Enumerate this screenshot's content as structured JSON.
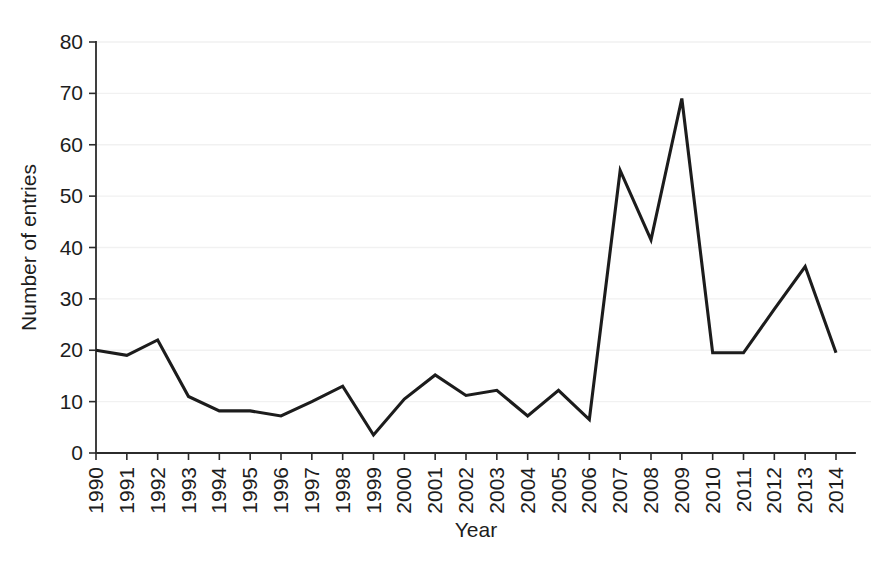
{
  "chart_data": {
    "type": "line",
    "title": "",
    "xlabel": "Year",
    "ylabel": "Number of entries",
    "x": [
      1990,
      1991,
      1992,
      1993,
      1994,
      1995,
      1996,
      1997,
      1998,
      1999,
      2000,
      2001,
      2002,
      2003,
      2004,
      2005,
      2006,
      2007,
      2008,
      2009,
      2010,
      2011,
      2012,
      2013,
      2014
    ],
    "categories": [
      "1990",
      "1991",
      "1992",
      "1993",
      "1994",
      "1995",
      "1996",
      "1997",
      "1998",
      "1999",
      "2000",
      "2001",
      "2002",
      "2003",
      "2004",
      "2005",
      "2006",
      "2007",
      "2008",
      "2009",
      "2010",
      "2011",
      "2012",
      "2013",
      "2014"
    ],
    "values": [
      20,
      19,
      22,
      11,
      8.2,
      8.2,
      7.2,
      10,
      13,
      3.5,
      10.5,
      15.2,
      11.2,
      12.2,
      7.2,
      12.2,
      6.5,
      55,
      41.5,
      69,
      19.5,
      19.5,
      28,
      36.3,
      19.5
    ],
    "series": [
      {
        "name": "Number of entries",
        "values": [
          20,
          19,
          22,
          11,
          8.2,
          8.2,
          7.2,
          10,
          13,
          3.5,
          10.5,
          15.2,
          11.2,
          12.2,
          7.2,
          12.2,
          6.5,
          55,
          41.5,
          69,
          19.5,
          19.5,
          28,
          36.3,
          19.5
        ]
      }
    ],
    "xtick_labels": [
      "1990",
      "1991",
      "1992",
      "1993",
      "1994",
      "1995",
      "1996",
      "1997",
      "1998",
      "1999",
      "2000",
      "2001",
      "2002",
      "2003",
      "2004",
      "2005",
      "2006",
      "2007",
      "2008",
      "2009",
      "2010",
      "2011",
      "2012",
      "2013",
      "2014"
    ],
    "ytick_labels": [
      "0",
      "10",
      "20",
      "30",
      "40",
      "50",
      "60",
      "70",
      "80"
    ],
    "yticks": [
      0,
      10,
      20,
      30,
      40,
      50,
      60,
      70,
      80
    ],
    "ylim": [
      0,
      80
    ],
    "xlim": [
      1990,
      2014
    ],
    "grid": "horizontal",
    "grid_color": "#f1f1f1",
    "line_color": "#1c1c1c",
    "axis_color": "#2b2b2b",
    "background_color": "#ffffff",
    "legend": null,
    "legend_position": "none",
    "xtick_rotation": 90
  }
}
